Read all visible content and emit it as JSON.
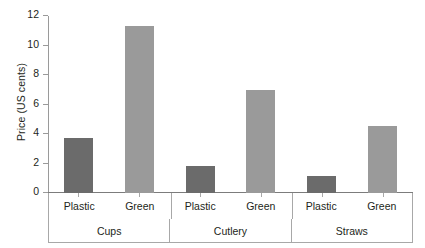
{
  "chart_data": {
    "type": "bar",
    "title": "",
    "xlabel": "",
    "ylabel": "Price (US cents)",
    "ylim": [
      0,
      12
    ],
    "yticks": [
      0,
      2,
      4,
      6,
      8,
      10,
      12
    ],
    "ytick_labels": [
      "0",
      "2",
      "4",
      "6",
      "8",
      "10",
      "12"
    ],
    "grid": false,
    "legend": "none",
    "categories": [
      "Cups",
      "Cutlery",
      "Straws"
    ],
    "subcategories": [
      "Plastic",
      "Green"
    ],
    "series": [
      {
        "name": "Plastic",
        "color": "#6b6b6b",
        "values": [
          3.7,
          1.8,
          1.15
        ]
      },
      {
        "name": "Green",
        "color": "#9a9a9a",
        "values": [
          11.3,
          7.0,
          4.55
        ]
      }
    ],
    "groups": [
      {
        "label": "Cups",
        "bars": [
          {
            "label": "Plastic",
            "value": 3.7,
            "color": "#6b6b6b"
          },
          {
            "label": "Green",
            "value": 11.3,
            "color": "#9a9a9a"
          }
        ]
      },
      {
        "label": "Cutlery",
        "bars": [
          {
            "label": "Plastic",
            "value": 1.8,
            "color": "#6b6b6b"
          },
          {
            "label": "Green",
            "value": 7.0,
            "color": "#9a9a9a"
          }
        ]
      },
      {
        "label": "Straws",
        "bars": [
          {
            "label": "Plastic",
            "value": 1.15,
            "color": "#6b6b6b"
          },
          {
            "label": "Green",
            "value": 4.55,
            "color": "#9a9a9a"
          }
        ]
      }
    ]
  },
  "axis": {
    "y_title": "Price (US cents)",
    "axis_color": "#9a9a9a",
    "baseline_color": "#7c7c7c",
    "table_border_color": "#a8a8a8"
  }
}
